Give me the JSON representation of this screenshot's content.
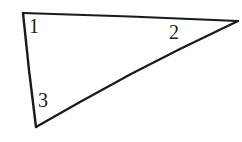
{
  "figure": {
    "name": "triangle-with-numbered-angles",
    "background_color": "#ffffff",
    "stroke_color": "#1a1a1a",
    "label_color": "#1a1a1a",
    "stroke_width": 2.2,
    "width": 242,
    "height": 142
  },
  "triangle": {
    "type": "scalene",
    "vertices": [
      {
        "name": "vertex-top-left",
        "x": 23,
        "y": 13
      },
      {
        "name": "vertex-right",
        "x": 238,
        "y": 21
      },
      {
        "name": "vertex-bottom-left",
        "x": 36,
        "y": 127
      }
    ],
    "edges": [
      {
        "name": "edge-top",
        "from": "vertex-top-left",
        "to": "vertex-right"
      },
      {
        "name": "edge-hypotenuse",
        "from": "vertex-right",
        "to": "vertex-bottom-left"
      },
      {
        "name": "edge-left",
        "from": "vertex-bottom-left",
        "to": "vertex-top-left"
      }
    ]
  },
  "labels": {
    "angle_1": "1",
    "angle_2": "2",
    "angle_3": "3"
  }
}
